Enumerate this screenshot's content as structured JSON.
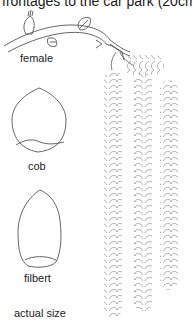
{
  "document": {
    "top_text_fragment": "frontages to the car park (20cm).",
    "illustration": {
      "subject": "hazel branch with catkins and nuts",
      "labels": {
        "female": "female",
        "cob": "cob",
        "filbert": "filbert",
        "scale_note": "actual size"
      },
      "line_color": "#555555",
      "background": "#ffffff"
    }
  }
}
